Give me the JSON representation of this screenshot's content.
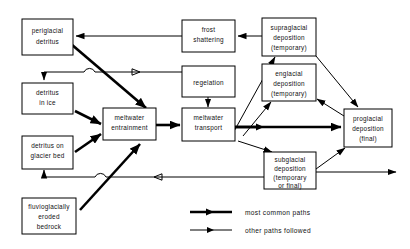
{
  "diagram": {
    "nodes": [
      {
        "id": "periglacial",
        "label_lines": [
          "periglacial",
          "detritus"
        ]
      },
      {
        "id": "detritus_ice",
        "label_lines": [
          "detritus",
          "in ice"
        ]
      },
      {
        "id": "detritus_bed",
        "label_lines": [
          "detritus on",
          "glacier bed"
        ]
      },
      {
        "id": "fluvioglacial",
        "label_lines": [
          "fluvioglacially",
          "eroded",
          "bedrock"
        ]
      },
      {
        "id": "entrainment",
        "label_lines": [
          "meltwater",
          "entrainment"
        ]
      },
      {
        "id": "frost",
        "label_lines": [
          "frost",
          "shattering"
        ]
      },
      {
        "id": "regelation",
        "label_lines": [
          "regelation"
        ]
      },
      {
        "id": "transport",
        "label_lines": [
          "meltwater",
          "transport"
        ]
      },
      {
        "id": "supraglacial",
        "label_lines": [
          "supraglacial",
          "deposition",
          "(temporary)"
        ]
      },
      {
        "id": "englacial",
        "label_lines": [
          "englacial",
          "deposition",
          "(temporary)"
        ]
      },
      {
        "id": "subglacial",
        "label_lines": [
          "subglacial",
          "deposition",
          "(temporary",
          "or final)"
        ]
      },
      {
        "id": "proglacial",
        "label_lines": [
          "proglacial",
          "deposition",
          "(final)"
        ]
      }
    ],
    "edges": [
      {
        "from": "frost",
        "to": "periglacial",
        "style": "other"
      },
      {
        "from": "periglacial",
        "to": "detritus_ice",
        "style": "other"
      },
      {
        "from": "periglacial",
        "to": "entrainment",
        "style": "common"
      },
      {
        "from": "regelation",
        "to": "detritus_ice",
        "style": "other"
      },
      {
        "from": "detritus_ice",
        "to": "entrainment",
        "style": "common"
      },
      {
        "from": "detritus_bed",
        "to": "entrainment",
        "style": "common"
      },
      {
        "from": "detritus_bed",
        "to": "fluvioglacial",
        "style": "other"
      },
      {
        "from": "fluvioglacial",
        "to": "entrainment",
        "style": "common"
      },
      {
        "from": "entrainment",
        "to": "transport",
        "style": "common"
      },
      {
        "from": "regelation",
        "to": "transport",
        "style": "other"
      },
      {
        "from": "supraglacial",
        "to": "frost",
        "style": "other"
      },
      {
        "from": "transport",
        "to": "supraglacial",
        "style": "other"
      },
      {
        "from": "transport",
        "to": "englacial",
        "style": "other"
      },
      {
        "from": "transport",
        "to": "subglacial",
        "style": "other"
      },
      {
        "from": "transport",
        "to": "proglacial",
        "style": "common"
      },
      {
        "from": "supraglacial",
        "to": "proglacial",
        "style": "other"
      },
      {
        "from": "englacial",
        "to": "proglacial",
        "style": "other"
      },
      {
        "from": "subglacial",
        "to": "proglacial",
        "style": "other"
      },
      {
        "from": "subglacial",
        "to": "detritus_bed",
        "style": "other"
      }
    ],
    "legend": {
      "items": [
        {
          "id": "common",
          "label": "most common paths"
        },
        {
          "id": "other",
          "label": "other paths followed"
        }
      ]
    },
    "colors": {
      "line": "#000000",
      "box_fill": "#ffffff",
      "text": "#111111",
      "background": "#ffffff"
    }
  }
}
